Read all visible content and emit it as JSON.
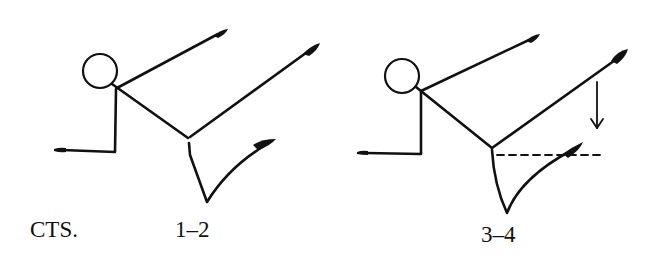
{
  "diagram": {
    "labels": {
      "counts_prefix": "CTS.",
      "figure_1_counts": "1–2",
      "figure_2_counts": "3–4"
    },
    "colors": {
      "ink": "#111111",
      "background": "#ffffff"
    },
    "figures": [
      {
        "id": "figure-1",
        "counts": "1–2",
        "head": {
          "cx": 100,
          "cy": 71,
          "r": 17
        },
        "neck": [
          117,
          88
        ],
        "raised_arm_tip": [
          225,
          31
        ],
        "hip": [
          188,
          138
        ],
        "kicking_leg_tip": [
          318,
          45
        ],
        "lower_arm": {
          "elbow": [
            115,
            152
          ],
          "hand": [
            53,
            150
          ]
        },
        "standing_leg": {
          "hip": [
            189,
            143
          ],
          "knee": [
            207,
            202
          ],
          "foot": [
            275,
            140
          ]
        }
      },
      {
        "id": "figure-2",
        "counts": "3–4",
        "head": {
          "cx": 402,
          "cy": 76,
          "r": 17
        },
        "neck": [
          421,
          90
        ],
        "raised_arm_tip": [
          538,
          36
        ],
        "hip": [
          492,
          148
        ],
        "kicking_leg_tip": [
          627,
          52
        ],
        "lower_arm": {
          "elbow": [
            421,
            154
          ],
          "hand": [
            357,
            152
          ]
        },
        "standing_leg": {
          "hip": [
            492,
            150
          ],
          "knee": [
            507,
            213
          ],
          "foot": [
            582,
            143
          ]
        },
        "annotations": {
          "down_arrow": {
            "x": 597,
            "y1": 82,
            "y2": 128,
            "meaning": "lower the kicking leg"
          },
          "dashed_guide": {
            "y": 155,
            "x1": 497,
            "x2": 600,
            "meaning": "target height level with hip"
          }
        }
      }
    ]
  }
}
